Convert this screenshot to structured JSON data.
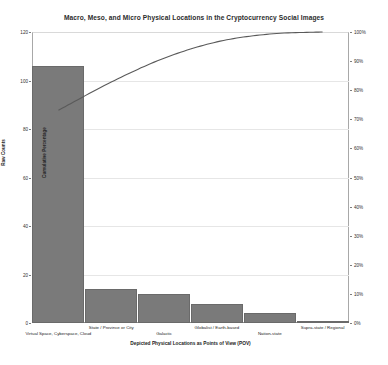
{
  "chart_data": {
    "type": "bar",
    "title": "Macro, Meso, and Micro Physical Locations in the Cryptocurrency Social Images",
    "xlabel": "Depicted Physical Locations as Points of View (POV)",
    "ylabel": "Raw Counts",
    "ylabel_secondary": "Cumulative Percentage",
    "categories": [
      "Virtual Space, Cyberspace, Cloud",
      "State / Province or City",
      "Galactic",
      "Globalist / Earth-based",
      "Nation-state",
      "Supra-state / Regional"
    ],
    "values": [
      106,
      14,
      12,
      8,
      4,
      1
    ],
    "series": [
      {
        "name": "Raw Counts",
        "type": "bar",
        "values": [
          106,
          14,
          12,
          8,
          4,
          1
        ]
      },
      {
        "name": "Cumulative Percentage",
        "type": "line",
        "values": [
          73.1,
          82.8,
          91.0,
          96.6,
          99.3,
          100.0
        ]
      }
    ],
    "ylim": [
      0,
      120
    ],
    "yticks": [
      0,
      20,
      40,
      60,
      80,
      100,
      120
    ],
    "ylim_secondary": [
      0,
      100
    ],
    "yticks_secondary": [
      "0%",
      "10%",
      "20%",
      "30%",
      "40%",
      "50%",
      "60%",
      "70%",
      "80%",
      "90%",
      "100%"
    ],
    "grid": true,
    "legend": "none"
  }
}
